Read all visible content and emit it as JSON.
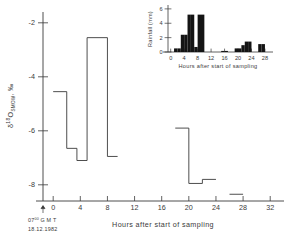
{
  "figure": {
    "background_color": "#ffffff",
    "line_color": "#3a3a3a",
    "bar_color": "#141414"
  },
  "main_plot": {
    "y_axis": {
      "label_delta": "δ",
      "label_sup": "18",
      "label_o": "O",
      "label_sub": "SMOW",
      "label_tail": ", ‰",
      "ticks": [
        "-2",
        "-4",
        "-6",
        "-8"
      ],
      "tick_values": [
        -2,
        -4,
        -6,
        -8
      ],
      "range": [
        -8.6,
        -1.6
      ]
    },
    "x_axis": {
      "title": "Hours after start of sampling",
      "ticks": [
        "0",
        "4",
        "8",
        "12",
        "16",
        "20",
        "24",
        "28",
        "32"
      ],
      "tick_values": [
        0,
        4,
        8,
        12,
        16,
        20,
        24,
        28,
        32
      ],
      "range": [
        -1.5,
        33
      ]
    },
    "time_stamp": {
      "line1_main": "07",
      "line1_sup": "00",
      "line1_tail": "G M T",
      "line2": "18.12.1982",
      "arrow_at_hour": 0
    }
  },
  "inset_plot": {
    "y_axis": {
      "label": "Rainfall (mm)",
      "ticks": [
        "0",
        "2",
        "4",
        "6"
      ],
      "tick_values": [
        0,
        2,
        4,
        6
      ],
      "range": [
        0,
        6.4
      ]
    },
    "x_axis": {
      "title": "Hours after start of sampling",
      "ticks": [
        "0",
        "4",
        "8",
        "12",
        "16",
        "20",
        "24",
        "28"
      ],
      "tick_values": [
        0,
        4,
        8,
        12,
        16,
        20,
        24,
        28
      ],
      "range": [
        -0.8,
        29.5
      ]
    }
  },
  "chart_data": [
    {
      "type": "line",
      "name": "oxygen-18-step-series",
      "title": "",
      "xlabel": "Hours after start of sampling",
      "ylabel": "δ18O SMOW, ‰",
      "xlim": [
        -1.5,
        33
      ],
      "ylim": [
        -8.6,
        -1.6
      ],
      "grid": false,
      "legend": "none",
      "style": "step-post",
      "segments": [
        {
          "x_start": 0.0,
          "x_end": 2.0,
          "y": -4.55
        },
        {
          "x_start": 2.0,
          "x_end": 3.5,
          "y": -6.65
        },
        {
          "x_start": 3.5,
          "x_end": 5.0,
          "y": -7.1
        },
        {
          "x_start": 5.0,
          "x_end": 8.0,
          "y": -2.55
        },
        {
          "x_start": 8.0,
          "x_end": 9.5,
          "y": -6.95
        },
        {
          "x_start": 18.0,
          "x_end": 20.0,
          "y": -5.9
        },
        {
          "x_start": 20.0,
          "x_end": 22.0,
          "y": -7.95
        },
        {
          "x_start": 22.0,
          "x_end": 24.0,
          "y": -7.8
        },
        {
          "x_start": 26.0,
          "x_end": 28.0,
          "y": -8.35
        }
      ]
    },
    {
      "type": "bar",
      "name": "rainfall-histogram-inset",
      "title": "",
      "xlabel": "Hours after start of sampling",
      "ylabel": "Rainfall (mm)",
      "xlim": [
        -0.8,
        29.5
      ],
      "ylim": [
        0,
        6.4
      ],
      "grid": false,
      "legend": "none",
      "bin_width": 1,
      "bins": [
        {
          "x_start": 1,
          "x_end": 2,
          "value": 0.5
        },
        {
          "x_start": 2,
          "x_end": 3,
          "value": 0.5
        },
        {
          "x_start": 3,
          "x_end": 4,
          "value": 2.4
        },
        {
          "x_start": 4,
          "x_end": 5,
          "value": 2.4
        },
        {
          "x_start": 5,
          "x_end": 6,
          "value": 5.2
        },
        {
          "x_start": 6,
          "x_end": 7,
          "value": 5.2
        },
        {
          "x_start": 7,
          "x_end": 8,
          "value": 0.7
        },
        {
          "x_start": 8,
          "x_end": 9,
          "value": 5.2
        },
        {
          "x_start": 9,
          "x_end": 10,
          "value": 5.2
        },
        {
          "x_start": 15,
          "x_end": 16,
          "value": 0.15
        },
        {
          "x_start": 16,
          "x_end": 17,
          "value": 0.15
        },
        {
          "x_start": 19,
          "x_end": 20,
          "value": 0.5
        },
        {
          "x_start": 20,
          "x_end": 21,
          "value": 0.5
        },
        {
          "x_start": 21,
          "x_end": 22,
          "value": 0.95
        },
        {
          "x_start": 22,
          "x_end": 23,
          "value": 1.45
        },
        {
          "x_start": 23,
          "x_end": 24,
          "value": 1.45
        },
        {
          "x_start": 26,
          "x_end": 27,
          "value": 1.1
        },
        {
          "x_start": 27,
          "x_end": 28,
          "value": 1.1
        }
      ]
    }
  ]
}
